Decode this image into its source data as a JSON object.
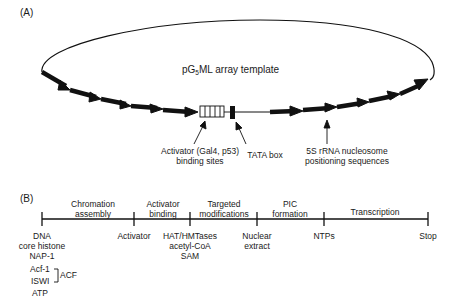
{
  "panel_a": {
    "label": "(A)",
    "title_pre": "pG",
    "title_sub": "5",
    "title_post": "ML array template",
    "annotations": {
      "activator_line1": "Activator (Gal4, p53)",
      "activator_line2": "binding sites",
      "tata": "TATA box",
      "rrna_line1": "5S rRNA nucleosome",
      "rrna_line2": "positioning sequences"
    }
  },
  "panel_b": {
    "label": "(B)",
    "stages": [
      {
        "line1": "Chromation",
        "line2": "assembly"
      },
      {
        "line1": "Activator",
        "line2": "binding"
      },
      {
        "line1": "Targeted",
        "line2": "modifications"
      },
      {
        "line1": "PIC",
        "line2": "formation"
      },
      {
        "line1": "Transcription",
        "line2": ""
      }
    ],
    "ticks": [
      {
        "lines": [
          "DNA",
          "core histone",
          "NAP-1"
        ]
      },
      {
        "lines": [
          "Activator"
        ]
      },
      {
        "lines": [
          "HAT/HMTases",
          "acetyl-CoA",
          "SAM"
        ]
      },
      {
        "lines": [
          "Nuclear",
          "extract"
        ]
      },
      {
        "lines": [
          "NTPs"
        ]
      },
      {
        "lines": [
          "Stop"
        ]
      }
    ],
    "acf_group": {
      "items": [
        "Acf-1",
        "ISWI"
      ],
      "label": "ACF",
      "after": "ATP"
    }
  }
}
